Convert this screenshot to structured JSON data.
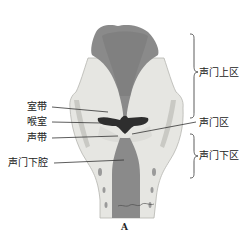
{
  "figure": {
    "caption": "A",
    "colors": {
      "mucosa": "#8a8a8a",
      "mucosa_dark": "#6f6f6f",
      "cartilage": "#e6e6e2",
      "cartilage_shade": "#c9c9c4",
      "ventricle": "#2e2e2e",
      "line": "#333333"
    },
    "left_labels": [
      {
        "text": "室带"
      },
      {
        "text": "喉室"
      },
      {
        "text": "声带"
      },
      {
        "text": "声门下腔"
      }
    ],
    "right_labels": [
      {
        "text": "声门上区"
      },
      {
        "text": "声门区"
      },
      {
        "text": "声门下区"
      }
    ],
    "signature": "Wayne Klug"
  }
}
